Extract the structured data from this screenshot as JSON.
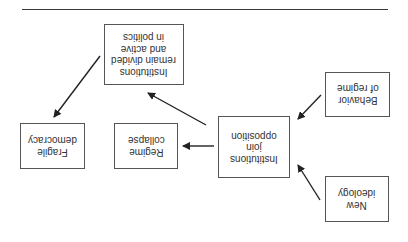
{
  "orientation": "rotated-180",
  "diagram": {
    "nodes": [
      {
        "id": "new-ideology",
        "label": "New\nideology"
      },
      {
        "id": "behavior-of-regime",
        "label": "Behavior\nof regime"
      },
      {
        "id": "institutions-join-opposition",
        "label": "Institutions\njoin\nopposition"
      },
      {
        "id": "regime-collapse",
        "label": "Regime\ncollapse"
      },
      {
        "id": "institutions-remain-divided",
        "label": "Institutions\nremain divided\nand active\nin politics"
      },
      {
        "id": "fragile-democracy",
        "label": "Fragile\ndemocracy"
      }
    ],
    "edges": [
      {
        "from": "new-ideology",
        "to": "institutions-join-opposition"
      },
      {
        "from": "behavior-of-regime",
        "to": "institutions-join-opposition"
      },
      {
        "from": "institutions-join-opposition",
        "to": "regime-collapse"
      },
      {
        "from": "institutions-join-opposition",
        "to": "institutions-remain-divided"
      },
      {
        "from": "institutions-remain-divided",
        "to": "fragile-democracy"
      }
    ]
  },
  "colors": {
    "line": "#3a3a3a",
    "box_border": "#555555",
    "text": "#333333"
  }
}
